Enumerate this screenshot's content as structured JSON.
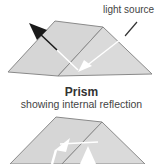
{
  "diagram": {
    "top_figure": {
      "label": "light source",
      "colors": {
        "face": "#d4d4d4",
        "face_front": "#dcdcdc",
        "edge": "#8a8a8a",
        "arrow_out": "#1a1a1a",
        "arrow_in": "#ffffff"
      }
    },
    "caption": {
      "title": "Prism",
      "subtitle": "showing internal reflection"
    },
    "bottom_figure": {
      "colors": {
        "face": "#d4d4d4",
        "edge": "#8a8a8a",
        "arrow": "#ffffff"
      }
    }
  }
}
